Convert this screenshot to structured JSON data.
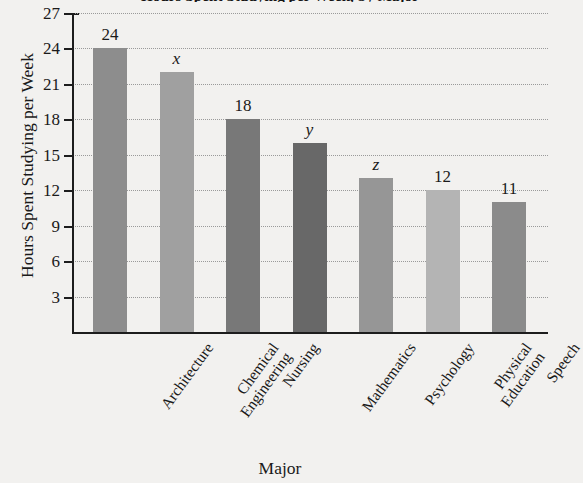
{
  "chart_data": {
    "type": "bar",
    "title": "Hours Spent Studying per Week, by Major",
    "xlabel": "Major",
    "ylabel": "Hours Spent Studying per Week",
    "categories": [
      "Architecture",
      "Chemical Engineering",
      "Nursing",
      "Mathematics",
      "Psychology",
      "Physical Education",
      "Speech"
    ],
    "category_lines": [
      [
        "Architecture"
      ],
      [
        "Chemical",
        "Engineering"
      ],
      [
        "Nursing"
      ],
      [
        "Mathematics"
      ],
      [
        "Psychology"
      ],
      [
        "Physical",
        "Education"
      ],
      [
        "Speech"
      ]
    ],
    "values": [
      24,
      22,
      18,
      16,
      13,
      12,
      11
    ],
    "value_labels": [
      "24",
      "x",
      "18",
      "y",
      "z",
      "12",
      "11"
    ],
    "value_label_italic": [
      false,
      true,
      false,
      true,
      true,
      false,
      false
    ],
    "bar_colors": [
      "#8d8d8d",
      "#a0a0a0",
      "#787878",
      "#686868",
      "#969696",
      "#b4b4b4",
      "#8b8b8b"
    ],
    "ylim": [
      0,
      27
    ],
    "yticks": [
      3,
      6,
      9,
      12,
      15,
      18,
      21,
      24,
      27
    ],
    "ytick_labels": [
      "3",
      "6",
      "9",
      "12",
      "15",
      "18",
      "21",
      "24",
      "27"
    ],
    "grid": true,
    "grid_axis": "y",
    "legend": "none",
    "background_color": "#f2f1ef",
    "axis_color": "#1d1d1d",
    "gridline_color": "#9a9a9a"
  }
}
